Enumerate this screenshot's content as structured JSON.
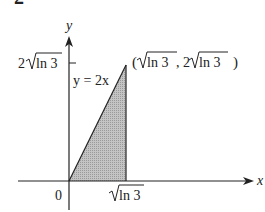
{
  "header_fragment": "2",
  "axes": {
    "x_label": "x",
    "y_label": "y",
    "origin_label": "0",
    "x_tick_label": {
      "radical": "ln 3",
      "display": "√ln 3"
    },
    "y_tick_label": {
      "coef": "2",
      "radical": "ln 3",
      "display": "2√ln 3"
    }
  },
  "curve_label": "y = 2x",
  "point_label": {
    "open": "(",
    "x_radical": "ln 3",
    "sep": ", 2",
    "y_radical": "ln 3",
    "close": ")",
    "display": "(√ln 3, 2√ln 3)"
  },
  "region": {
    "description": "Shaded triangle bounded by y = 2x, x = √ln 3, and the x-axis",
    "fill": "#b8b8b8",
    "stroke": "#222222"
  }
}
